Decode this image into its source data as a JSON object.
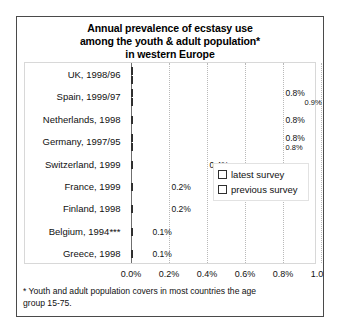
{
  "chart_data": {
    "type": "bar",
    "orientation": "horizontal",
    "title": "Annual prevalence of ecstasy use among the youth & adult population* in western Europe",
    "title_lines": [
      "Annual prevalence of ecstasy use",
      "among the youth & adult population*",
      "in western Europe"
    ],
    "xlabel": "",
    "ylabel": "",
    "xlim": [
      0.0,
      1.0
    ],
    "xticks": [
      0.0,
      0.2,
      0.4,
      0.6,
      0.8,
      1.0
    ],
    "xtick_labels": [
      "0.0%",
      "0.2%",
      "0.4%",
      "0.6%",
      "0.8%",
      "1.0%"
    ],
    "grid": true,
    "legend_position": "center-right",
    "categories": [
      "UK, 1998/96",
      "Spain, 1999/97",
      "Netherlands, 1998",
      "Germany, 1997/95",
      "Switzerland, 1999",
      "France, 1999",
      "Finland, 1998",
      "Belgium, 1994***",
      "Greece, 1998"
    ],
    "series": [
      {
        "name": "latest survey",
        "values": [
          1.0,
          0.8,
          0.8,
          0.8,
          0.4,
          0.2,
          0.2,
          0.1,
          0.1
        ],
        "labels": [
          "1.0%",
          "0.8%",
          "0.8%",
          "0.8%",
          "0.4%",
          "0.2%",
          "0.2%",
          "0.1%",
          "0.1%"
        ]
      },
      {
        "name": "previous survey",
        "values": [
          1.0,
          0.9,
          null,
          0.8,
          null,
          null,
          null,
          null,
          null
        ],
        "labels": [
          "1.0%",
          "0.9%",
          null,
          "0.8%",
          null,
          null,
          null,
          null,
          null
        ]
      }
    ],
    "annotations": [
      "* Youth and adult population covers in most countries the age group 15-75."
    ]
  },
  "legend": {
    "items": [
      {
        "label": "latest survey"
      },
      {
        "label": "previous survey"
      }
    ]
  },
  "footnote": {
    "lines": [
      "* Youth and adult population covers in most countries the age",
      "group  15-75."
    ]
  },
  "colors": {
    "frame": "#4a4a4a",
    "bar_outline": "#2f2f2f",
    "bar_fill_latest": "#e3e3e3",
    "bar_fill_previous": "#f4f4f4",
    "gridline": "#b9b9b9",
    "axis": "#6f6f6f",
    "text": "#111111"
  }
}
